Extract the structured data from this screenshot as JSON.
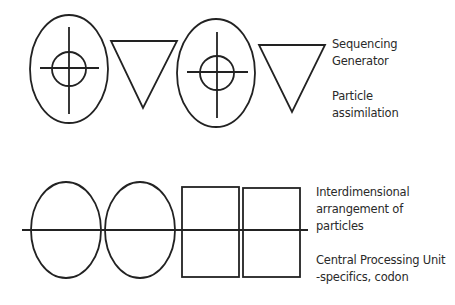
{
  "diagram": {
    "top_row": {
      "symbols": [
        {
          "type": "ellipse-crosshair",
          "cx": 69,
          "cy": 69,
          "rx": 39,
          "ry": 54,
          "inner_r": 17
        },
        {
          "type": "inverted-triangle",
          "points": "111,41 177,41 143,108"
        },
        {
          "type": "ellipse-crosshair",
          "cx": 216,
          "cy": 73,
          "rx": 39,
          "ry": 54,
          "inner_r": 17
        },
        {
          "type": "inverted-triangle",
          "points": "259,45 325,45 292,112"
        }
      ],
      "labels": [
        {
          "lines": [
            "Sequencing",
            "Generator"
          ]
        },
        {
          "lines": [
            "Particle",
            "assimilation"
          ]
        }
      ]
    },
    "bottom_row": {
      "symbols": [
        {
          "type": "ellipse",
          "cx": 66,
          "cy": 230,
          "rx": 35,
          "ry": 48
        },
        {
          "type": "ellipse",
          "cx": 140,
          "cy": 230,
          "rx": 35,
          "ry": 48
        },
        {
          "type": "square",
          "x": 182,
          "y": 187,
          "w": 57,
          "h": 90
        },
        {
          "type": "square",
          "x": 243,
          "y": 188,
          "w": 57,
          "h": 89
        }
      ],
      "axis_line": {
        "x1": 22,
        "x2": 308,
        "y": 230
      },
      "labels": [
        {
          "lines": [
            "Interdimensional",
            "arrangement of",
            "particles"
          ]
        },
        {
          "lines": [
            "Central Processing Unit",
            "-specifics, codon"
          ]
        }
      ]
    },
    "colors": {
      "stroke": "#222222",
      "text": "#2a2a2a",
      "background": "#ffffff"
    }
  }
}
